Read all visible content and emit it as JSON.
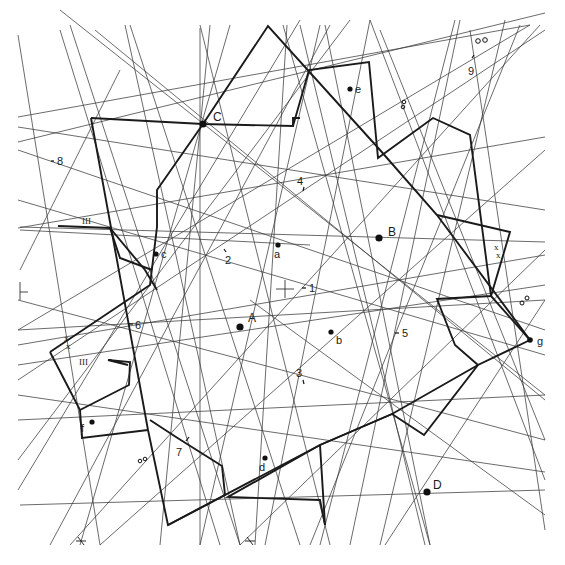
{
  "diagram": {
    "type": "geometric-construction",
    "background": "#ffffff",
    "line_color": "#3a3a3a",
    "outline_color": "#1a1a1a",
    "major_points": [
      {
        "id": "A",
        "label": "A",
        "x": 240,
        "y": 327
      },
      {
        "id": "B",
        "label": "B",
        "x": 379,
        "y": 238
      },
      {
        "id": "C",
        "label": "C",
        "x": 203,
        "y": 124
      },
      {
        "id": "D",
        "label": "D",
        "x": 427,
        "y": 492
      }
    ],
    "minor_points": [
      {
        "id": "a",
        "label": "a",
        "x": 278,
        "y": 245
      },
      {
        "id": "b",
        "label": "b",
        "x": 331,
        "y": 332
      },
      {
        "id": "c",
        "label": "c",
        "x": 156,
        "y": 254
      },
      {
        "id": "d",
        "label": "d",
        "x": 265,
        "y": 458
      },
      {
        "id": "e",
        "label": "e",
        "x": 350,
        "y": 89
      },
      {
        "id": "f",
        "label": "f",
        "x": 92,
        "y": 422
      },
      {
        "id": "g",
        "label": "g",
        "x": 530,
        "y": 340
      }
    ],
    "numbered_ticks": [
      {
        "label": "1",
        "x": 310,
        "y": 288
      },
      {
        "label": "2",
        "x": 228,
        "y": 262
      },
      {
        "label": "3",
        "x": 300,
        "y": 378
      },
      {
        "label": "4",
        "x": 300,
        "y": 185
      },
      {
        "label": "5",
        "x": 403,
        "y": 334
      },
      {
        "label": "6",
        "x": 138,
        "y": 325
      },
      {
        "label": "7",
        "x": 180,
        "y": 453
      },
      {
        "label": "8",
        "x": 59,
        "y": 162
      },
      {
        "label": "9",
        "x": 471,
        "y": 72
      }
    ],
    "symbols": [
      {
        "name": "triple-bar-mark",
        "text": "III",
        "x": 88,
        "y": 221
      },
      {
        "name": "triple-bar-mark",
        "text": "III",
        "x": 86,
        "y": 362
      },
      {
        "name": "double-cross-mark",
        "text": "x x",
        "x": 497,
        "y": 252
      },
      {
        "name": "double-cross-mark",
        "text": "x x",
        "x": 68,
        "y": 342
      },
      {
        "name": "double-circle-mark",
        "text": "oo",
        "x": 480,
        "y": 42
      },
      {
        "name": "double-circle-mark",
        "text": "oo",
        "x": 525,
        "y": 300
      },
      {
        "name": "infinity-mark",
        "text": "∞",
        "x": 404,
        "y": 105
      },
      {
        "name": "infinity-mark",
        "text": "∞",
        "x": 141,
        "y": 460
      }
    ],
    "center_cross": {
      "x": 285,
      "y": 289
    },
    "left_edge_cross": {
      "x": 20,
      "y": 292
    }
  }
}
